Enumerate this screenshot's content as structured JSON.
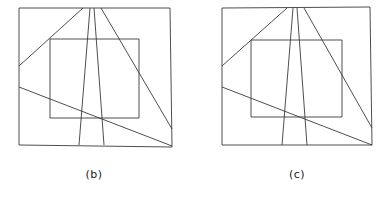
{
  "figure": {
    "background_color": "#ffffff",
    "stroke_color": "#3a3a3a",
    "stroke_width": 0.9,
    "width": 385,
    "height": 197,
    "panels": [
      {
        "id": "panel-b",
        "caption": "(b)",
        "caption_x": 94,
        "caption_y": 176,
        "outer_quad": {
          "name": "outer-frame",
          "points": "19,8 170,8 172,147 19,145"
        },
        "inner_rect": {
          "name": "inner-rect",
          "points": "50,39 139,39 139,118 50,118"
        },
        "lines": [
          {
            "name": "line-b-1",
            "x1": 19,
            "y1": 66,
            "x2": 83,
            "y2": 8
          },
          {
            "name": "line-b-2",
            "x1": 90,
            "y1": 8,
            "x2": 79,
            "y2": 145
          },
          {
            "name": "line-b-3",
            "x1": 94,
            "y1": 8,
            "x2": 104,
            "y2": 145
          },
          {
            "name": "line-b-4",
            "x1": 101,
            "y1": 8,
            "x2": 172,
            "y2": 129
          },
          {
            "name": "line-b-5",
            "x1": 19,
            "y1": 87,
            "x2": 172,
            "y2": 146
          }
        ]
      },
      {
        "id": "panel-c",
        "caption": "(c)",
        "caption_x": 297,
        "caption_y": 176,
        "outer_quad": {
          "name": "outer-frame",
          "points": "222,8 370,7 372,145 222,145"
        },
        "inner_rect": {
          "name": "inner-rect",
          "points": "251,40 342,40 342,117 251,117"
        },
        "lines": [
          {
            "name": "line-c-1",
            "x1": 222,
            "y1": 66,
            "x2": 287,
            "y2": 8
          },
          {
            "name": "line-c-2",
            "x1": 293,
            "y1": 8,
            "x2": 282,
            "y2": 145
          },
          {
            "name": "line-c-3",
            "x1": 297,
            "y1": 8,
            "x2": 307,
            "y2": 145
          },
          {
            "name": "line-c-4",
            "x1": 304,
            "y1": 8,
            "x2": 372,
            "y2": 128
          },
          {
            "name": "line-c-5",
            "x1": 222,
            "y1": 87,
            "x2": 372,
            "y2": 145
          }
        ]
      }
    ]
  }
}
